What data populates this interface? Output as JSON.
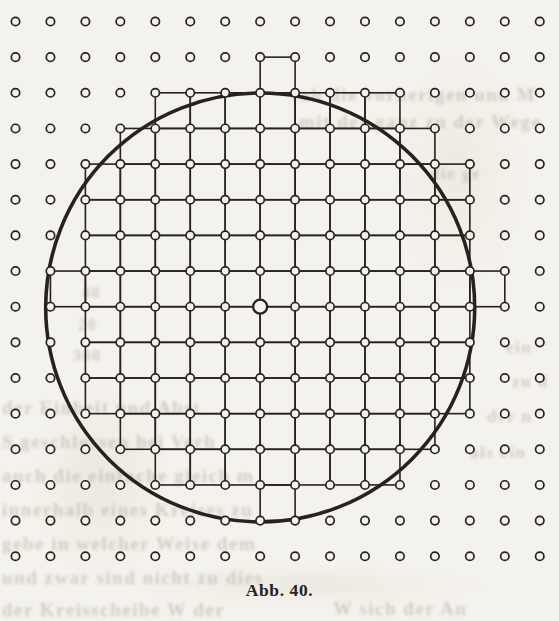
{
  "page": {
    "caption": "Abb. 40.",
    "paper_color": "#f4f2ec",
    "ink_color": "#26231f",
    "bleed_color": "#b2afa1"
  },
  "figure": {
    "lattice": {
      "cols": 16,
      "rows": 16,
      "x0": 15.5,
      "y0": 21.5,
      "dx": 34.95,
      "dy": 35.65,
      "dot_radius": 4.2,
      "dot_stroke_width": 1.7
    },
    "grid_line_width": 1.6,
    "circle": {
      "cx": 260.2,
      "cy": 307.5,
      "r": 214.5,
      "stroke_width": 3.6
    },
    "center_dot": {
      "col": 7,
      "row": 8,
      "radius": 7.0,
      "stroke_width": 2.3
    },
    "radius_in_lattice_units": 6,
    "lattice_points_inside_or_on_circle": 113,
    "filled_cell_rows": [
      {
        "row": 1,
        "from": 7,
        "to": 7
      },
      {
        "row": 2,
        "from": 4,
        "to": 10
      },
      {
        "row": 3,
        "from": 3,
        "to": 11
      },
      {
        "row": 4,
        "from": 2,
        "to": 12
      },
      {
        "row": 5,
        "from": 2,
        "to": 12
      },
      {
        "row": 6,
        "from": 2,
        "to": 12
      },
      {
        "row": 7,
        "from": 1,
        "to": 13
      },
      {
        "row": 8,
        "from": 2,
        "to": 12
      },
      {
        "row": 9,
        "from": 2,
        "to": 12
      },
      {
        "row": 10,
        "from": 2,
        "to": 12
      },
      {
        "row": 11,
        "from": 3,
        "to": 11
      },
      {
        "row": 12,
        "from": 4,
        "to": 10
      },
      {
        "row": 13,
        "from": 7,
        "to": 7
      }
    ]
  },
  "bleedthrough": {
    "note": "faint illegible print showing through from the reverse side of the page",
    "fragments": [
      {
        "x": 291,
        "y": 84,
        "fs": 19,
        "w": 268,
        "t": "sah die vorherigen und M"
      },
      {
        "x": 299,
        "y": 111,
        "fs": 19,
        "w": 260,
        "t": "mit der ganz zu der Wege"
      },
      {
        "x": 430,
        "y": 164,
        "fs": 17,
        "w": 129,
        "t": "die ge"
      },
      {
        "x": 82,
        "y": 284,
        "fs": 16,
        "w": 40,
        "t": "40"
      },
      {
        "x": 78,
        "y": 316,
        "fs": 16,
        "w": 40,
        "t": "20"
      },
      {
        "x": 73,
        "y": 347,
        "fs": 16,
        "w": 48,
        "t": "300"
      },
      {
        "x": 2,
        "y": 397,
        "fs": 19,
        "w": 240,
        "t": "der Einheit und Abst"
      },
      {
        "x": 2,
        "y": 431,
        "fs": 19,
        "w": 250,
        "t": "S geschlossen bei Verh"
      },
      {
        "x": 2,
        "y": 465,
        "fs": 19,
        "w": 255,
        "t": "auch die einfache gleich m"
      },
      {
        "x": 2,
        "y": 499,
        "fs": 19,
        "w": 258,
        "t": "innerhalb eines Kreises zu b"
      },
      {
        "x": 2,
        "y": 533,
        "fs": 19,
        "w": 258,
        "t": "gebe in welcher Weise dem g"
      },
      {
        "x": 2,
        "y": 567,
        "fs": 19,
        "w": 260,
        "t": "und zwar sind nicht zu diesem P"
      },
      {
        "x": 2,
        "y": 599,
        "fs": 19,
        "w": 228,
        "t": "der Kreisscheibe W der"
      },
      {
        "x": 333,
        "y": 598,
        "fs": 19,
        "w": 226,
        "t": "W sich der An"
      },
      {
        "x": 506,
        "y": 338,
        "fs": 17,
        "w": 53,
        "t": "ein"
      },
      {
        "x": 512,
        "y": 372,
        "fs": 17,
        "w": 47,
        "t": "zu d"
      },
      {
        "x": 487,
        "y": 407,
        "fs": 17,
        "w": 72,
        "t": "der n"
      },
      {
        "x": 470,
        "y": 443,
        "fs": 17,
        "w": 89,
        "t": "als ein"
      }
    ]
  }
}
